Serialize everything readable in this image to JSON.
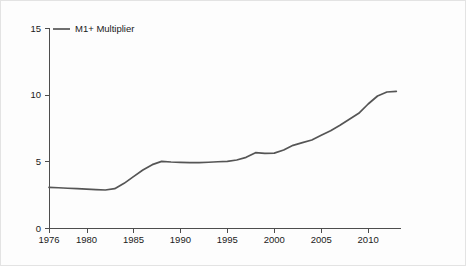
{
  "chart_data": {
    "type": "line",
    "title": "",
    "subtitle": "",
    "xlabel": "",
    "ylabel": "",
    "xlim": [
      1976,
      2013.5
    ],
    "ylim": [
      0,
      15
    ],
    "grid": false,
    "legend_position": "top-left",
    "legend": [
      "M1+ Multiplier"
    ],
    "y_ticks": [
      0,
      5,
      10,
      15
    ],
    "y_tick_labels": [
      "0",
      "5",
      "10",
      "15"
    ],
    "x_ticks": [
      1976,
      1980,
      1985,
      1990,
      1995,
      2000,
      2005,
      2010
    ],
    "x_tick_labels": [
      "1976",
      "1980",
      "1985",
      "1990",
      "1995",
      "2000",
      "2005",
      "2010"
    ],
    "series": [
      {
        "name": "M1+ Multiplier",
        "color": "#555555",
        "x": [
          1976,
          1977,
          1978,
          1979,
          1980,
          1981,
          1982,
          1983,
          1984,
          1985,
          1986,
          1987,
          1988,
          1989,
          1990,
          1991,
          1992,
          1993,
          1994,
          1995,
          1996,
          1997,
          1998,
          1999,
          2000,
          2001,
          2002,
          2003,
          2004,
          2005,
          2006,
          2007,
          2008,
          2009,
          2010,
          2011,
          2012,
          2013
        ],
        "values": [
          3.05,
          3.02,
          2.98,
          2.95,
          2.92,
          2.88,
          2.85,
          2.95,
          3.35,
          3.85,
          4.35,
          4.75,
          5.0,
          4.95,
          4.92,
          4.9,
          4.9,
          4.93,
          4.97,
          5.0,
          5.1,
          5.3,
          5.65,
          5.6,
          5.62,
          5.85,
          6.2,
          6.4,
          6.6,
          6.95,
          7.3,
          7.7,
          8.15,
          8.6,
          9.3,
          9.9,
          10.2,
          10.25
        ]
      }
    ]
  },
  "axes": {
    "y_axis_name": "value-axis",
    "x_axis_name": "year-axis"
  },
  "legend": {
    "entries": [
      {
        "label": "M1+ Multiplier",
        "color": "#555555"
      }
    ]
  },
  "colors": {
    "series_line": "#555555",
    "axis": "#4d4d4d",
    "text": "#1a1a1a",
    "background": "#fdfdfd",
    "border": "#e3e3e3"
  }
}
